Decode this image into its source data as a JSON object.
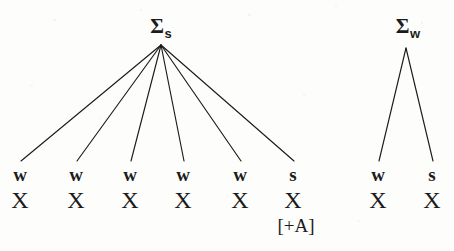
{
  "figure": {
    "kind": "metrical-tree-diagram",
    "background_color": "#fdfdfc",
    "ink_color": "#1b1b1b",
    "width": 454,
    "height": 251
  },
  "trees": [
    {
      "id": "left-tree",
      "root": {
        "symbol": "Σ",
        "subscript": "s",
        "x": 161,
        "y": 16
      },
      "apex": {
        "x": 161,
        "y": 45
      },
      "terminals": [
        {
          "label": "w",
          "slot": "X",
          "x": 20,
          "feature": ""
        },
        {
          "label": "w",
          "slot": "X",
          "x": 76,
          "feature": ""
        },
        {
          "label": "w",
          "slot": "X",
          "x": 130,
          "feature": ""
        },
        {
          "label": "w",
          "slot": "X",
          "x": 183,
          "feature": ""
        },
        {
          "label": "w",
          "slot": "X",
          "x": 240,
          "feature": ""
        },
        {
          "label": "s",
          "slot": "X",
          "x": 293,
          "feature": "[+A]"
        }
      ]
    },
    {
      "id": "right-tree",
      "root": {
        "symbol": "Σ",
        "subscript": "w",
        "x": 408,
        "y": 16
      },
      "apex": {
        "x": 406,
        "y": 48
      },
      "terminals": [
        {
          "label": "w",
          "slot": "X",
          "x": 378,
          "feature": ""
        },
        {
          "label": "s",
          "slot": "X",
          "x": 432,
          "feature": ""
        }
      ]
    }
  ],
  "rows": {
    "terminal_label_y": 165,
    "slot_y": 188,
    "feature_y": 216
  }
}
